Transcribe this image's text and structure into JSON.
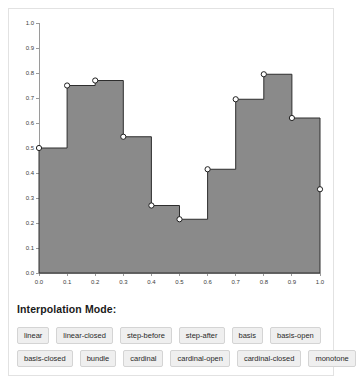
{
  "chart_data": {
    "type": "area",
    "title": "",
    "xlabel": "",
    "ylabel": "",
    "interpolation": "step-after",
    "grid": false,
    "legend": false,
    "fill_color": "#8a8a8a",
    "line_color": "#2e2e2e",
    "marker_fill": "#ffffff",
    "xlim": [
      0.0,
      1.0
    ],
    "ylim": [
      0.0,
      1.0
    ],
    "x_ticks": [
      "0.0",
      "0.1",
      "0.2",
      "0.3",
      "0.4",
      "0.5",
      "0.6",
      "0.7",
      "0.8",
      "0.9",
      "1.0"
    ],
    "y_ticks": [
      "0.0",
      "0.1",
      "0.2",
      "0.3",
      "0.4",
      "0.5",
      "0.6",
      "0.7",
      "0.8",
      "0.9",
      "1.0"
    ],
    "x": [
      0.0,
      0.1,
      0.2,
      0.3,
      0.4,
      0.5,
      0.6,
      0.7,
      0.8,
      0.9,
      1.0
    ],
    "values": [
      0.5,
      0.75,
      0.77,
      0.545,
      0.27,
      0.215,
      0.415,
      0.695,
      0.795,
      0.62,
      0.335
    ]
  },
  "controls": {
    "title": "Interpolation Mode:",
    "rows": [
      [
        "linear",
        "linear-closed",
        "step-before",
        "step-after",
        "basis",
        "basis-open"
      ],
      [
        "basis-closed",
        "bundle",
        "cardinal",
        "cardinal-open",
        "cardinal-closed",
        "monotone"
      ]
    ]
  }
}
